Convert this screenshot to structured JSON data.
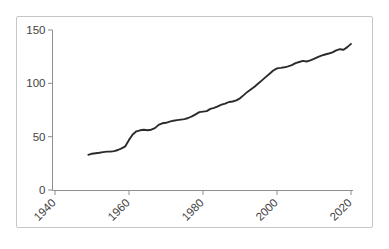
{
  "chart_data": {
    "type": "line",
    "title": "",
    "xlabel": "",
    "ylabel": "",
    "legend": false,
    "grid": false,
    "xlim": [
      1940,
      2020
    ],
    "ylim": [
      0,
      150
    ],
    "xticks": [
      1940,
      1960,
      1980,
      2000,
      2020
    ],
    "yticks": [
      0,
      50,
      100,
      150
    ],
    "x": [
      1949,
      1950,
      1951,
      1952,
      1953,
      1954,
      1955,
      1956,
      1957,
      1958,
      1959,
      1960,
      1961,
      1962,
      1963,
      1964,
      1965,
      1966,
      1967,
      1968,
      1969,
      1970,
      1971,
      1972,
      1973,
      1974,
      1975,
      1976,
      1977,
      1978,
      1979,
      1980,
      1981,
      1982,
      1983,
      1984,
      1985,
      1986,
      1987,
      1988,
      1989,
      1990,
      1991,
      1992,
      1993,
      1994,
      1995,
      1996,
      1997,
      1998,
      1999,
      2000,
      2001,
      2002,
      2003,
      2004,
      2005,
      2006,
      2007,
      2008,
      2009,
      2010,
      2011,
      2012,
      2013,
      2014,
      2015,
      2016,
      2017,
      2018,
      2019,
      2020
    ],
    "values": [
      33,
      34,
      34.5,
      35,
      35.5,
      36,
      36,
      36.5,
      37.5,
      39,
      41,
      47,
      52,
      55,
      56,
      56.5,
      56,
      56.5,
      58,
      61,
      62.5,
      63,
      64,
      65,
      65.5,
      66,
      66.5,
      67.5,
      69,
      71,
      73,
      73.5,
      74,
      76,
      77,
      78.5,
      80,
      81,
      82.5,
      83,
      84,
      86,
      89,
      92,
      94.5,
      97,
      100,
      103,
      106,
      109,
      112,
      114,
      114.5,
      115,
      116,
      117,
      119,
      120,
      121,
      120.5,
      121.5,
      123,
      124.5,
      126,
      127,
      128,
      129,
      131,
      132,
      131.5,
      134,
      137
    ],
    "colors": {
      "line": "#2b2b2b",
      "axis": "#8f8f8f",
      "tick_label": "#3f3f3f",
      "frame_border": "#c6c6c6",
      "background": "#ffffff"
    }
  }
}
